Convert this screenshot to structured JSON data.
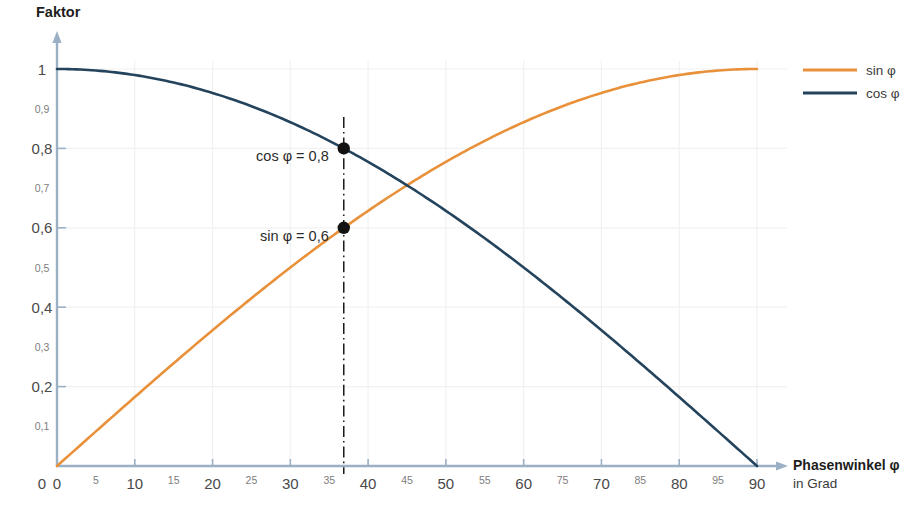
{
  "chart_data": {
    "type": "line",
    "title": "",
    "ylabel": "Faktor",
    "xlabel": "Phasenwinkel φ",
    "xlabel_sub": "in Grad",
    "xlim": [
      0,
      90
    ],
    "ylim": [
      0,
      1
    ],
    "grid": true,
    "legend_position": "right",
    "x_tick_labels_major": [
      "0",
      "10",
      "20",
      "30",
      "40",
      "50",
      "60",
      "70",
      "80",
      "90"
    ],
    "x_tick_values_major": [
      0,
      10,
      20,
      30,
      40,
      50,
      60,
      70,
      80,
      90
    ],
    "x_tick_labels_minor": [
      "5",
      "15",
      "25",
      "35",
      "45",
      "55",
      "75",
      "85",
      "95"
    ],
    "x_tick_values_minor": [
      5,
      15,
      25,
      35,
      45,
      55,
      65,
      75,
      85
    ],
    "y_tick_labels_major": [
      "0",
      "0,2",
      "0,4",
      "0,6",
      "0,8",
      "1"
    ],
    "y_tick_values_major": [
      0,
      0.2,
      0.4,
      0.6,
      0.8,
      1
    ],
    "y_tick_labels_minor": [
      "0,1",
      "0,3",
      "0,5",
      "0,7",
      "0,9"
    ],
    "y_tick_values_minor": [
      0.1,
      0.3,
      0.5,
      0.7,
      0.9
    ],
    "series": [
      {
        "name": "sin φ",
        "color": "#E8913A",
        "x": [
          0,
          5,
          10,
          15,
          20,
          25,
          30,
          35,
          40,
          45,
          50,
          55,
          60,
          65,
          70,
          75,
          80,
          85,
          90
        ],
        "values": [
          0,
          0.087,
          0.174,
          0.259,
          0.342,
          0.423,
          0.5,
          0.574,
          0.643,
          0.707,
          0.766,
          0.819,
          0.866,
          0.906,
          0.94,
          0.966,
          0.985,
          0.996,
          1
        ]
      },
      {
        "name": "cos φ",
        "color": "#24435C",
        "x": [
          0,
          5,
          10,
          15,
          20,
          25,
          30,
          35,
          40,
          45,
          50,
          55,
          60,
          65,
          70,
          75,
          80,
          85,
          90
        ],
        "values": [
          1,
          0.996,
          0.985,
          0.966,
          0.94,
          0.906,
          0.866,
          0.819,
          0.766,
          0.707,
          0.643,
          0.574,
          0.5,
          0.423,
          0.342,
          0.259,
          0.174,
          0.087,
          0
        ]
      }
    ],
    "annotations": [
      {
        "label": "cos φ = 0,8",
        "x": 36.87,
        "y": 0.8
      },
      {
        "label": "sin φ = 0,6",
        "x": 36.87,
        "y": 0.6
      }
    ],
    "marker_line_x": 36.87
  },
  "legend": {
    "items": [
      {
        "label": "sin φ",
        "color": "#E8913A"
      },
      {
        "label": "cos φ",
        "color": "#24435C"
      }
    ]
  },
  "colors": {
    "sin": "#E8913A",
    "cos": "#24435C",
    "axis": "#9BB0C4",
    "grid": "#F1F1F1",
    "marker": "#121212"
  }
}
